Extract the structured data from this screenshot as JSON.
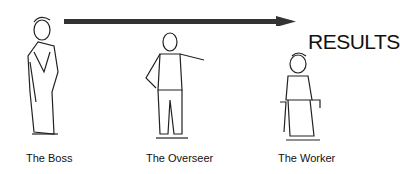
{
  "diagram": {
    "arrow_label": "RESULTS",
    "figures": [
      {
        "id": "boss",
        "label": "The Boss"
      },
      {
        "id": "overseer",
        "label": "The Overseer"
      },
      {
        "id": "worker",
        "label": "The Worker"
      }
    ],
    "colors": {
      "arrow": "#333333",
      "ink": "#111111",
      "background": "#ffffff"
    }
  }
}
